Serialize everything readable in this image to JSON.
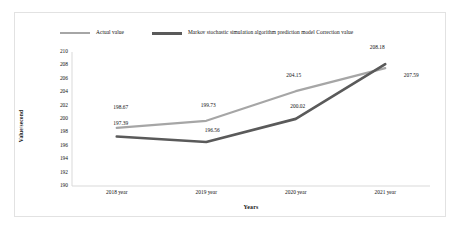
{
  "chart_data": {
    "type": "line",
    "title": "",
    "xlabel": "Years",
    "ylabel": "Value/second",
    "categories": [
      "2018 year",
      "2019 year",
      "2020 year",
      "2021 year"
    ],
    "ylim": [
      190,
      210
    ],
    "yticks": [
      210,
      208,
      206,
      204,
      202,
      200,
      198,
      196,
      194,
      192,
      190
    ],
    "grid": false,
    "legend_position": "top",
    "series": [
      {
        "name": "Actual value",
        "color": "#a6a6a6",
        "values": [
          198.67,
          199.73,
          204.15,
          207.59
        ],
        "labels": [
          "198.67",
          "199.73",
          "204.15",
          "207.59"
        ]
      },
      {
        "name": "Markov stochastic simulation algorithm prediction model  Correction value",
        "color": "#5a5a5a",
        "values": [
          197.39,
          196.56,
          200.02,
          208.18
        ],
        "labels": [
          "197.39",
          "196.56",
          "200.02",
          "208.18"
        ]
      }
    ]
  },
  "legend": {
    "entries": [
      {
        "label": "Actual value"
      },
      {
        "label": "Markov stochastic simulation algorithm prediction model  Correction value"
      }
    ]
  },
  "axes": {
    "y_title": "Value/second",
    "x_title": "Years"
  }
}
